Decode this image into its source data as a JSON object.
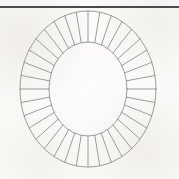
{
  "page": {
    "width": 179,
    "height": 179,
    "background_color": "#fbfaf7",
    "figure_title": "Segmented elliptical ring"
  },
  "rule": {
    "name": "top-horizontal-rule",
    "x1": 0,
    "y1": 7,
    "x2": 179,
    "y2": 7,
    "color": "#4a4a48",
    "stroke_width": 1.3
  },
  "figure": {
    "center_x": 88,
    "center_y": 89,
    "stroke_color": "#8d8b86",
    "stroke_width": 0.85,
    "fill": "none",
    "outer_ellipse": {
      "name": "outer-ellipse",
      "rx": 68,
      "ry": 78
    },
    "inner_ellipse": {
      "name": "inner-ellipse",
      "rx": 39,
      "ry": 47
    },
    "segments": {
      "count": 36,
      "start_angle_deg": -90,
      "description": "radial spokes dividing the annulus into equal angular segments"
    }
  },
  "chart_data": {
    "type": "pie",
    "subtitle": "",
    "xlabel": "",
    "ylabel": "",
    "legend_position": "none",
    "grid": false,
    "annotations": [],
    "categories": [
      "1",
      "2",
      "3",
      "4",
      "5",
      "6",
      "7",
      "8",
      "9",
      "10",
      "11",
      "12",
      "13",
      "14",
      "15",
      "16",
      "17",
      "18",
      "19",
      "20",
      "21",
      "22",
      "23",
      "24",
      "25",
      "26",
      "27",
      "28",
      "29",
      "30",
      "31",
      "32",
      "33",
      "34",
      "35",
      "36"
    ],
    "values": [
      10,
      10,
      10,
      10,
      10,
      10,
      10,
      10,
      10,
      10,
      10,
      10,
      10,
      10,
      10,
      10,
      10,
      10,
      10,
      10,
      10,
      10,
      10,
      10,
      10,
      10,
      10,
      10,
      10,
      10,
      10,
      10,
      10,
      10,
      10,
      10
    ],
    "segment_angle_deg": 10,
    "total_segments": 36,
    "inner_radius_x": 39,
    "inner_radius_y": 47,
    "outer_radius_x": 68,
    "outer_radius_y": 78
  }
}
